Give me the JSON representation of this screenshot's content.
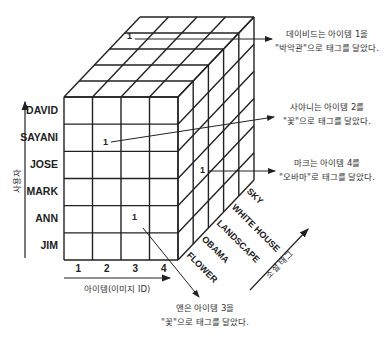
{
  "cube": {
    "front": {
      "x0": 64,
      "y0": 97,
      "x1": 178,
      "y1": 260
    },
    "depth_offset": {
      "dx": 76,
      "dy": -80
    },
    "columns": 4,
    "rows": 6,
    "depth_slices": 5,
    "line_color": "#222222"
  },
  "users_axis": {
    "label": "사용자",
    "users": [
      "DAVID",
      "SAYANI",
      "JOSE",
      "MARK",
      "ANN",
      "JIM"
    ]
  },
  "items_axis": {
    "label": "아이템(이미지 ID)",
    "items": [
      "1",
      "2",
      "3",
      "4"
    ]
  },
  "tags_axis": {
    "label": "소셜 태그",
    "tags": [
      "FLOWER",
      "OBAMA",
      "LANDSCAPE",
      "WHITE HOUSE",
      "SKY"
    ]
  },
  "cell_values": [
    {
      "id": "david",
      "value": "1",
      "x": 127,
      "y": 31
    },
    {
      "id": "sayani",
      "value": "1",
      "x": 103,
      "y": 137
    },
    {
      "id": "mark",
      "value": "1",
      "x": 200,
      "y": 165
    },
    {
      "id": "ann",
      "value": "1",
      "x": 132,
      "y": 212
    }
  ],
  "annotations": [
    {
      "id": "david",
      "line1": "데이비드는 아이템 1을",
      "line2": "\"박악관\"으로 태그를 달았다."
    },
    {
      "id": "sayani",
      "line1": "사야니는 아이템 2를",
      "line2": "\"꽃\"으로 태그를 달았다."
    },
    {
      "id": "mark",
      "line1": "마크는 아이템 4를",
      "line2": "\"오바마\"로 태그를 달았다."
    },
    {
      "id": "ann",
      "line1": "앤은 아이템 3을",
      "line2": "\"꽃\"으로 태그를 달았다."
    }
  ]
}
